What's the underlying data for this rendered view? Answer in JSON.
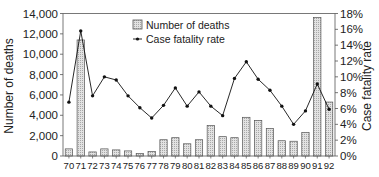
{
  "chart_data": {
    "type": "bar+line",
    "title": "",
    "xlabel": "",
    "categories": [
      "70",
      "71",
      "72",
      "73",
      "74",
      "75",
      "76",
      "77",
      "78",
      "79",
      "80",
      "81",
      "82",
      "83",
      "84",
      "85",
      "86",
      "87",
      "88",
      "89",
      "90",
      "91",
      "92"
    ],
    "series": [
      {
        "name": "Number of deaths",
        "type": "bar",
        "axis": "left",
        "values": [
          700,
          11400,
          400,
          700,
          600,
          500,
          250,
          450,
          1600,
          1800,
          1200,
          1600,
          3000,
          1900,
          1800,
          3800,
          3500,
          2700,
          1500,
          1450,
          2300,
          13600,
          5300
        ]
      },
      {
        "name": "Case fatality rate",
        "type": "line",
        "axis": "right",
        "unit": "%",
        "values": [
          6.8,
          15.8,
          7.6,
          10.0,
          9.6,
          7.6,
          6.1,
          4.8,
          6.4,
          8.6,
          6.3,
          8.1,
          6.3,
          5.1,
          9.8,
          11.9,
          9.7,
          8.3,
          6.3,
          4.0,
          5.7,
          9.1,
          5.9
        ]
      }
    ],
    "ylabel": "Number of deaths",
    "ylim": [
      0,
      14000
    ],
    "yticks": [
      "0",
      "2,000",
      "4,000",
      "6,000",
      "8,000",
      "10,000",
      "12,000",
      "14,000"
    ],
    "y2label": "Case fatality rate",
    "y2lim": [
      0,
      18
    ],
    "y2ticks": [
      "0%",
      "2%",
      "4%",
      "6%",
      "8%",
      "10%",
      "12%",
      "14%",
      "16%",
      "18%"
    ],
    "legend": {
      "position": "upper-center-inside",
      "entries": [
        "Number of deaths",
        "Case fatality rate"
      ]
    },
    "grid": false,
    "colors": {
      "bar_fill": "#d4d4d4",
      "bar_stroke": "#555555",
      "line": "#111111",
      "axis": "#555555"
    }
  }
}
